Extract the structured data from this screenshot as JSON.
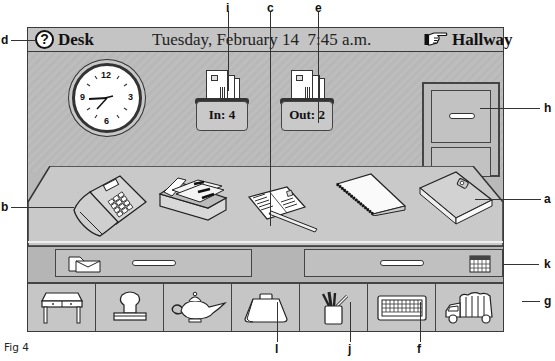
{
  "titlebar": {
    "help_icon": "?",
    "location": "Desk",
    "datetime": "Tuesday, February 14  7:45 a.m.",
    "nav_destination": "Hallway",
    "nav_icon": "pointing-hand-icon"
  },
  "clock": {
    "numerals": [
      "12",
      "3",
      "6",
      "9"
    ],
    "time": "7:45"
  },
  "trays": {
    "in": {
      "label": "In: 4",
      "count": 4
    },
    "out": {
      "label": "Out: 2",
      "count": 2
    }
  },
  "desk_items": [
    {
      "id": "phone",
      "icon": "telephone-icon"
    },
    {
      "id": "rolodex",
      "icon": "card-file-icon"
    },
    {
      "id": "postcard",
      "icon": "postcard-icon"
    },
    {
      "id": "notepad",
      "icon": "notepad-icon"
    },
    {
      "id": "address-book",
      "icon": "address-book-icon"
    }
  ],
  "drawers": [
    {
      "id": "mail-drawer",
      "icon": "envelopes-icon"
    },
    {
      "id": "calendar-drawer",
      "icon": "calendar-icon"
    }
  ],
  "toolbar": [
    {
      "id": "desk",
      "icon": "desk-icon"
    },
    {
      "id": "stamp",
      "icon": "stamp-icon"
    },
    {
      "id": "genie-lamp",
      "icon": "genie-lamp-icon"
    },
    {
      "id": "briefcase",
      "icon": "briefcase-icon"
    },
    {
      "id": "pencil-cup",
      "icon": "pencil-cup-icon"
    },
    {
      "id": "keyboard",
      "icon": "keyboard-icon"
    },
    {
      "id": "trash-truck",
      "icon": "garbage-truck-icon"
    }
  ],
  "callouts": {
    "a": "a",
    "b": "b",
    "c": "c",
    "d": "d",
    "e": "e",
    "f": "f",
    "g": "g",
    "h": "h",
    "i": "i",
    "j": "j",
    "k": "k",
    "l": "l"
  },
  "caption": {
    "line1": "Fig 4"
  }
}
